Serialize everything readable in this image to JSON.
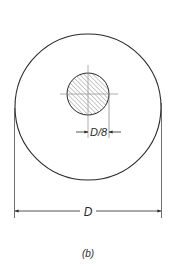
{
  "figure": {
    "caption": "(b)",
    "outer_circle": {
      "cx": 88,
      "cy": 107,
      "r": 73
    },
    "inner_circle": {
      "cx": 88,
      "cy": 94,
      "r": 21,
      "fill": "hatched"
    },
    "dimensions": {
      "small": {
        "label": "D/8"
      },
      "large": {
        "label": "D"
      }
    },
    "colors": {
      "line": "#2a2a2a",
      "hatch": "#777777",
      "center_line": "#999999"
    }
  }
}
